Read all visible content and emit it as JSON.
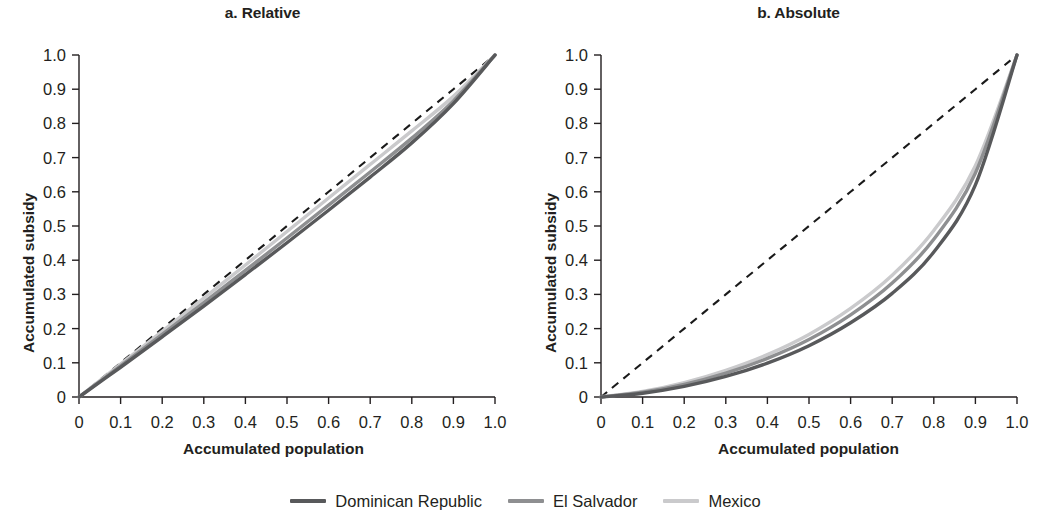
{
  "figure": {
    "background_color": "#ffffff",
    "panels": [
      {
        "id": "a",
        "title": "a. Relative",
        "xlabel": "Accumulated population",
        "ylabel": "Accumulated subsidy"
      },
      {
        "id": "b",
        "title": "b. Absolute",
        "xlabel": "Accumulated population",
        "ylabel": "Accumulated subsidy"
      }
    ]
  },
  "legend": {
    "position": "bottom-center",
    "items": [
      {
        "label": "Dominican Republic",
        "color": "#58595b"
      },
      {
        "label": "El Salvador",
        "color": "#8e8f91"
      },
      {
        "label": "Mexico",
        "color": "#cacacc"
      }
    ]
  },
  "axis": {
    "tick_labels": [
      "0",
      "0.1",
      "0.2",
      "0.3",
      "0.4",
      "0.5",
      "0.6",
      "0.7",
      "0.8",
      "0.9",
      "1.0"
    ],
    "ticks": [
      0,
      0.1,
      0.2,
      0.3,
      0.4,
      0.5,
      0.6,
      0.7,
      0.8,
      0.9,
      1.0
    ],
    "xlim": [
      0,
      1
    ],
    "ylim": [
      0,
      1
    ],
    "grid": false
  },
  "chart_data": [
    {
      "type": "line",
      "id": "a",
      "title": "a. Relative",
      "xlabel": "Accumulated population",
      "ylabel": "Accumulated subsidy",
      "xlim": [
        0,
        1
      ],
      "ylim": [
        0,
        1
      ],
      "grid": false,
      "xticks": [
        0,
        0.1,
        0.2,
        0.3,
        0.4,
        0.5,
        0.6,
        0.7,
        0.8,
        0.9,
        1.0
      ],
      "yticks": [
        0,
        0.1,
        0.2,
        0.3,
        0.4,
        0.5,
        0.6,
        0.7,
        0.8,
        0.9,
        1.0
      ],
      "xtick_labels": [
        "0",
        "0.1",
        "0.2",
        "0.3",
        "0.4",
        "0.5",
        "0.6",
        "0.7",
        "0.8",
        "0.9",
        "1.0"
      ],
      "ytick_labels": [
        "0",
        "0.1",
        "0.2",
        "0.3",
        "0.4",
        "0.5",
        "0.6",
        "0.7",
        "0.8",
        "0.9",
        "1.0"
      ],
      "x": [
        0,
        0.1,
        0.2,
        0.3,
        0.4,
        0.5,
        0.6,
        0.7,
        0.8,
        0.9,
        1.0
      ],
      "series": [
        {
          "name": "Dominican Republic",
          "color": "#58595b",
          "style": "solid",
          "values": [
            0,
            0.087,
            0.176,
            0.266,
            0.358,
            0.451,
            0.546,
            0.643,
            0.743,
            0.858,
            1.0
          ]
        },
        {
          "name": "El Salvador",
          "color": "#8e8f91",
          "style": "solid",
          "values": [
            0,
            0.091,
            0.183,
            0.276,
            0.37,
            0.465,
            0.561,
            0.658,
            0.757,
            0.866,
            1.0
          ]
        },
        {
          "name": "Mexico",
          "color": "#cacacc",
          "style": "solid",
          "values": [
            0,
            0.096,
            0.192,
            0.289,
            0.386,
            0.484,
            0.582,
            0.68,
            0.778,
            0.879,
            1.0
          ]
        },
        {
          "name": "Line of equality",
          "color": "#1a1a1a",
          "style": "dashed",
          "values": [
            0,
            0.1,
            0.2,
            0.3,
            0.4,
            0.5,
            0.6,
            0.7,
            0.8,
            0.9,
            1.0
          ]
        }
      ]
    },
    {
      "type": "line",
      "id": "b",
      "title": "b. Absolute",
      "xlabel": "Accumulated population",
      "ylabel": "Accumulated subsidy",
      "xlim": [
        0,
        1
      ],
      "ylim": [
        0,
        1
      ],
      "grid": false,
      "xticks": [
        0,
        0.1,
        0.2,
        0.3,
        0.4,
        0.5,
        0.6,
        0.7,
        0.8,
        0.9,
        1.0
      ],
      "yticks": [
        0,
        0.1,
        0.2,
        0.3,
        0.4,
        0.5,
        0.6,
        0.7,
        0.8,
        0.9,
        1.0
      ],
      "xtick_labels": [
        "0",
        "0.1",
        "0.2",
        "0.3",
        "0.4",
        "0.5",
        "0.6",
        "0.7",
        "0.8",
        "0.9",
        "1.0"
      ],
      "ytick_labels": [
        "0",
        "0.1",
        "0.2",
        "0.3",
        "0.4",
        "0.5",
        "0.6",
        "0.7",
        "0.8",
        "0.9",
        "1.0"
      ],
      "x": [
        0,
        0.1,
        0.2,
        0.3,
        0.4,
        0.5,
        0.6,
        0.7,
        0.8,
        0.9,
        1.0
      ],
      "series": [
        {
          "name": "Dominican Republic",
          "color": "#58595b",
          "style": "solid",
          "values": [
            0,
            0.011,
            0.031,
            0.06,
            0.099,
            0.15,
            0.217,
            0.303,
            0.424,
            0.62,
            1.0
          ]
        },
        {
          "name": "El Salvador",
          "color": "#8e8f91",
          "style": "solid",
          "values": [
            0,
            0.014,
            0.037,
            0.07,
            0.113,
            0.168,
            0.24,
            0.333,
            0.461,
            0.655,
            1.0
          ]
        },
        {
          "name": "Mexico",
          "color": "#cacacc",
          "style": "solid",
          "values": [
            0,
            0.016,
            0.042,
            0.078,
            0.124,
            0.183,
            0.259,
            0.356,
            0.487,
            0.676,
            1.0
          ]
        },
        {
          "name": "Line of equality",
          "color": "#1a1a1a",
          "style": "dashed",
          "values": [
            0,
            0.1,
            0.2,
            0.3,
            0.4,
            0.5,
            0.6,
            0.7,
            0.8,
            0.9,
            1.0
          ]
        }
      ]
    }
  ]
}
